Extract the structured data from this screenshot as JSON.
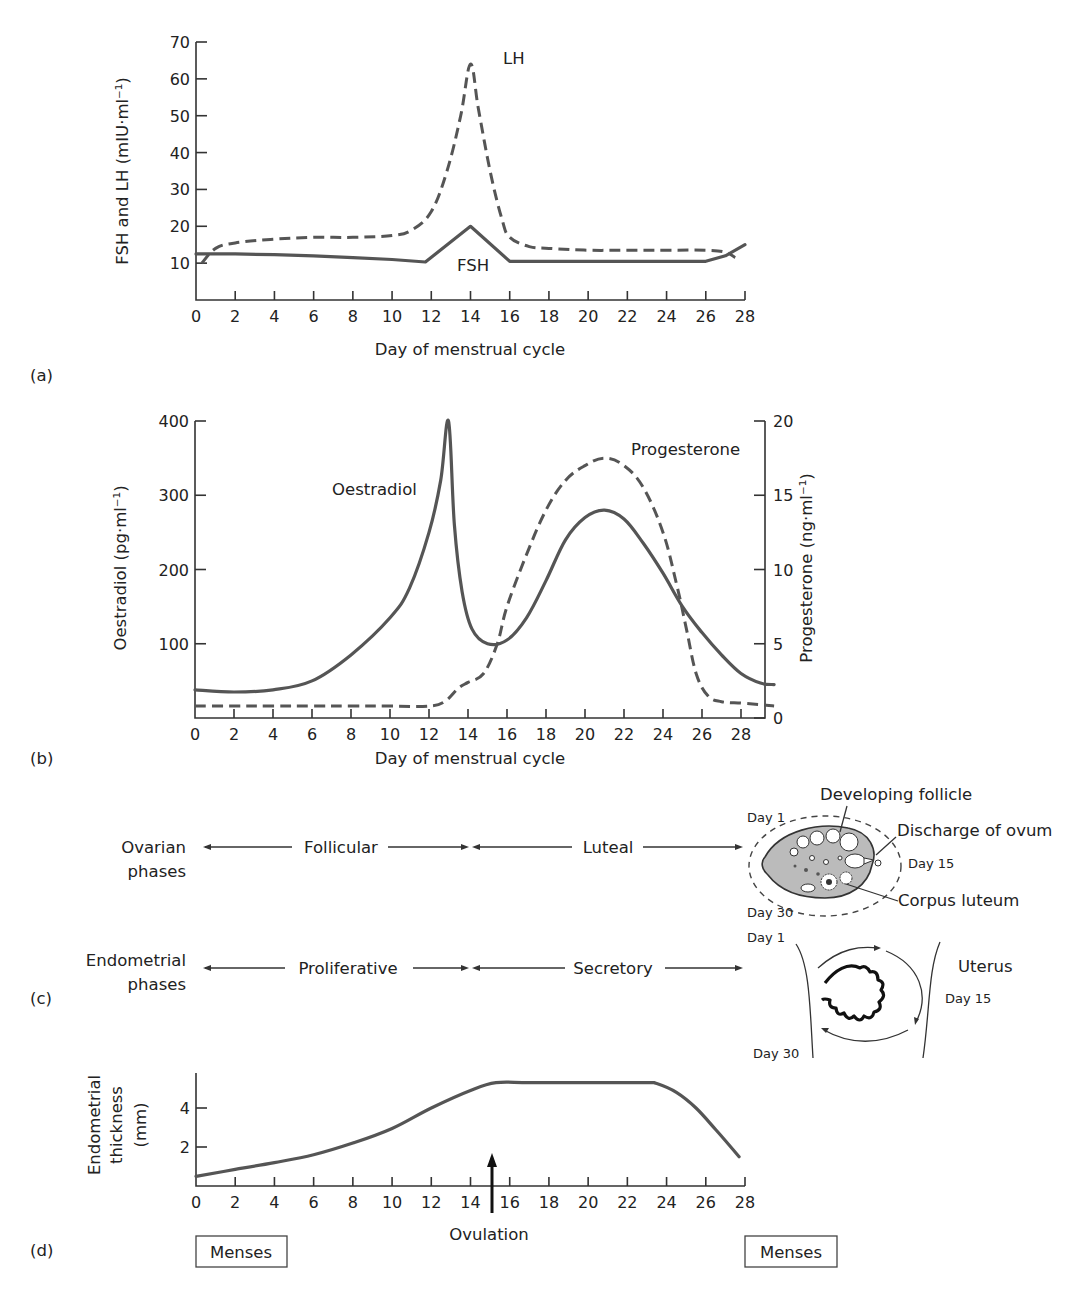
{
  "chart_data": [
    {
      "id": "a",
      "panel_label": "(a)",
      "type": "line",
      "title": "",
      "xlabel": "Day of menstrual cycle",
      "ylabel": "FSH and LH (mIU·ml⁻¹)",
      "xlim": [
        0,
        28
      ],
      "ylim": [
        0,
        70
      ],
      "x_ticks": [
        0,
        2,
        4,
        6,
        8,
        10,
        12,
        14,
        16,
        18,
        20,
        22,
        24,
        26,
        28
      ],
      "y_ticks": [
        10,
        20,
        30,
        40,
        50,
        60,
        70
      ],
      "grid": false,
      "series": [
        {
          "name": "LH",
          "style": "dashed",
          "x": [
            0.3,
            1,
            2,
            4,
            6,
            8,
            10,
            11,
            12,
            12.8,
            13.5,
            14,
            14.4,
            15,
            15.6,
            16,
            17,
            18,
            20,
            22,
            24,
            26,
            27,
            27.5
          ],
          "y": [
            10,
            14,
            15.5,
            16.5,
            17,
            17,
            17.5,
            19,
            24,
            35,
            50,
            64,
            52,
            35,
            22,
            17,
            14.5,
            14,
            13.5,
            13.5,
            13.5,
            13.5,
            13,
            11.5
          ]
        },
        {
          "name": "FSH",
          "style": "solid",
          "x": [
            0,
            2,
            4,
            6,
            8,
            10,
            11.7,
            14,
            16,
            18,
            20,
            22,
            24,
            26,
            27,
            28
          ],
          "y": [
            12.5,
            12.5,
            12.3,
            12,
            11.5,
            11,
            10.3,
            20,
            10.5,
            10.5,
            10.5,
            10.5,
            10.5,
            10.5,
            12,
            15
          ]
        }
      ],
      "annotations": [
        "LH",
        "FSH"
      ]
    },
    {
      "id": "b",
      "panel_label": "(b)",
      "type": "line",
      "title": "",
      "xlabel": "Day of menstrual cycle",
      "ylabel_left": "Oestradiol (pg·ml⁻¹)",
      "ylabel_right": "Progesterone (ng·ml⁻¹)",
      "xlim": [
        0,
        30
      ],
      "ylim_left": [
        0,
        400
      ],
      "ylim_right": [
        0,
        20
      ],
      "x_ticks": [
        0,
        2,
        4,
        6,
        8,
        10,
        12,
        14,
        16,
        18,
        20,
        22,
        24,
        26,
        28
      ],
      "y_ticks_left": [
        100,
        200,
        300,
        400
      ],
      "y_ticks_right": [
        0,
        5,
        10,
        15,
        20
      ],
      "grid": false,
      "series": [
        {
          "name": "Oestradiol",
          "axis": "left",
          "style": "solid",
          "x": [
            0,
            2,
            4,
            6,
            8,
            10,
            11,
            12,
            12.6,
            13,
            13.3,
            13.7,
            14.2,
            15,
            16,
            17,
            18,
            19,
            20,
            21,
            22,
            23,
            24,
            25,
            26,
            27,
            28,
            29,
            29.7
          ],
          "y": [
            38,
            35,
            38,
            50,
            85,
            135,
            175,
            250,
            320,
            400,
            260,
            170,
            120,
            100,
            105,
            135,
            185,
            240,
            270,
            280,
            268,
            235,
            195,
            150,
            115,
            85,
            60,
            47,
            45
          ]
        },
        {
          "name": "Progesterone",
          "axis": "right",
          "style": "dashed",
          "x": [
            0,
            2,
            4,
            6,
            8,
            10,
            12,
            12.8,
            13.5,
            14,
            14.8,
            15.5,
            16,
            17,
            18,
            19,
            20,
            21,
            22,
            23,
            24,
            24.7,
            25.2,
            25.7,
            26.3,
            27,
            28,
            29,
            29.7
          ],
          "y": [
            0.8,
            0.8,
            0.8,
            0.8,
            0.8,
            0.8,
            0.8,
            1.1,
            2,
            2.4,
            3,
            5,
            7.5,
            11,
            14,
            16,
            17,
            17.5,
            17,
            15.5,
            12.5,
            9,
            6,
            3,
            1.5,
            1.1,
            1,
            0.9,
            0.8
          ]
        }
      ],
      "annotations": [
        "Oestradiol",
        "Progesterone"
      ]
    },
    {
      "id": "d",
      "panel_label": "(d)",
      "type": "line",
      "title": "",
      "xlabel": "",
      "ylabel": "Endometrial thickness (mm)",
      "xlim": [
        0,
        28
      ],
      "ylim": [
        0,
        6
      ],
      "x_ticks": [
        0,
        2,
        4,
        6,
        8,
        10,
        12,
        14,
        16,
        18,
        20,
        22,
        24,
        26,
        28
      ],
      "y_ticks": [
        2,
        4
      ],
      "grid": false,
      "series": [
        {
          "name": "Endometrial thickness",
          "style": "solid",
          "x": [
            0,
            2,
            4,
            6,
            8,
            10,
            12,
            14,
            15.3,
            17,
            20,
            23,
            23.5,
            24.5,
            25.5,
            26.5,
            27.7
          ],
          "y": [
            0.5,
            0.85,
            1.2,
            1.6,
            2.2,
            2.95,
            4.0,
            4.9,
            5.3,
            5.3,
            5.3,
            5.3,
            5.25,
            4.8,
            4.0,
            2.9,
            1.5
          ]
        }
      ],
      "annotations": [
        {
          "label": "Ovulation",
          "day": 15
        }
      ]
    }
  ],
  "panel_a": {
    "label": "(a)",
    "xlabel": "Day of menstrual cycle",
    "ylabel": "FSH and LH (mIU·ml⁻¹)",
    "lh_label": "LH",
    "fsh_label": "FSH"
  },
  "panel_b": {
    "label": "(b)",
    "xlabel": "Day of menstrual cycle",
    "ylabel_left": "Oestradiol (pg·ml⁻¹)",
    "ylabel_right": "Progesterone (ng·ml⁻¹)",
    "oestradiol_label": "Oestradiol",
    "progesterone_label": "Progesterone"
  },
  "panel_c": {
    "label": "(c)",
    "ovarian": {
      "title_line1": "Ovarian",
      "title_line2": "phases",
      "phase1": "Follicular",
      "phase2": "Luteal"
    },
    "endometrial": {
      "title_line1": "Endometrial",
      "title_line2": "phases",
      "phase1": "Proliferative",
      "phase2": "Secretory"
    },
    "ovary_diagram": {
      "developing_follicle": "Developing follicle",
      "discharge": "Discharge of ovum",
      "corpus_luteum": "Corpus luteum",
      "day1": "Day 1",
      "day15": "Day 15",
      "day30": "Day 30"
    },
    "uterus_diagram": {
      "title": "Uterus",
      "day1": "Day 1",
      "day15": "Day 15",
      "day30": "Day 30"
    }
  },
  "panel_d": {
    "label": "(d)",
    "ylabel_line1": "Endometrial",
    "ylabel_line2": "thickness",
    "ylabel_line3": "(mm)",
    "ovulation": "Ovulation",
    "menses_left": "Menses",
    "menses_right": "Menses"
  }
}
